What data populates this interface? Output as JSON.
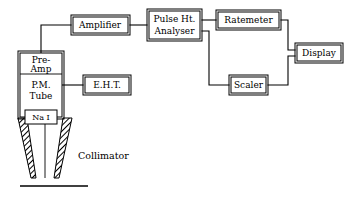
{
  "diagram": {
    "background_color": "#ffffff",
    "line_color": "#000000",
    "blocks": [
      {
        "id": "preamp",
        "label": "Pre-\nAmp",
        "line1": "Pre-",
        "line2": "Amp"
      },
      {
        "id": "pmtube",
        "label": "P.M.\nTube",
        "line1": "P.M.",
        "line2": "Tube"
      },
      {
        "id": "nai",
        "label": "Na I",
        "line1": "Na I",
        "line2": ""
      },
      {
        "id": "eht",
        "label": "E.H.T.",
        "line1": "E.H.T.",
        "line2": ""
      },
      {
        "id": "amplifier",
        "label": "Amplifier",
        "line1": "Amplifier",
        "line2": ""
      },
      {
        "id": "pha",
        "label": "Pulse Ht.\nAnalyser",
        "line1": "Pulse Ht.",
        "line2": "Analyser"
      },
      {
        "id": "ratemeter",
        "label": "Ratemeter",
        "line1": "Ratemeter",
        "line2": ""
      },
      {
        "id": "scaler",
        "label": "Scaler",
        "line1": "Scaler",
        "line2": ""
      },
      {
        "id": "display",
        "label": "Display",
        "line1": "Display",
        "line2": ""
      }
    ],
    "annotations": [
      {
        "id": "collimator",
        "label": "Collimator"
      }
    ]
  }
}
